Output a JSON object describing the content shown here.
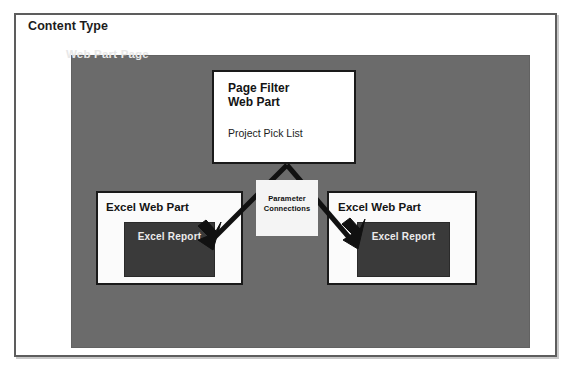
{
  "diagram": {
    "title": "Content Type",
    "container": {
      "label": "Web Part Page"
    },
    "page_filter": {
      "heading": "Page Filter\nWeb Part",
      "subtitle": "Project Pick List"
    },
    "connector": {
      "label": "Parameter\nConnections"
    },
    "web_parts": [
      {
        "title": "Excel Web Part",
        "report_label": "Excel Report"
      },
      {
        "title": "Excel Web Part",
        "report_label": "Excel Report"
      }
    ],
    "colors": {
      "frame_border": "#5d5d5d",
      "panel_fill": "#6b6b6b",
      "panel_text": "#e8e8e8",
      "box_border": "#1a1a1a",
      "box_fill": "#ffffff",
      "report_fill": "#3a3a3a",
      "report_text": "#ececec",
      "callout_fill": "#f4f4f4",
      "arrow": "#111111",
      "page_background": "#ffffff"
    }
  }
}
